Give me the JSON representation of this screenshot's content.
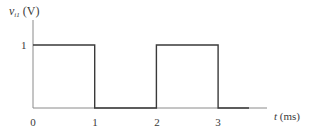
{
  "chart_data": {
    "type": "line",
    "title": "",
    "ylabel": "v_i1 (V)",
    "ylabel_var": "v",
    "ylabel_sub": "i1",
    "ylabel_unit": "(V)",
    "xlabel": "t (ms)",
    "xlabel_var": "t",
    "xlabel_unit": "(ms)",
    "x_ticks": [
      "0",
      "1",
      "2",
      "3"
    ],
    "y_ticks": [
      "1"
    ],
    "xlim": [
      0,
      3.8
    ],
    "ylim": [
      0,
      1.3
    ],
    "grid": false,
    "legend": null,
    "series": [
      {
        "name": "v_i1",
        "step": true,
        "x": [
          0,
          1,
          1,
          2,
          2,
          3,
          3,
          3.5
        ],
        "y": [
          1,
          1,
          0,
          0,
          1,
          1,
          0,
          0
        ]
      }
    ],
    "colors": {
      "axis": "#8a8a8a",
      "signal": "#3a3a3a",
      "text": "#3a3a3a"
    }
  }
}
